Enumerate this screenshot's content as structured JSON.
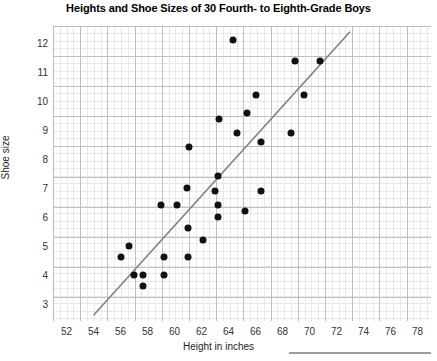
{
  "chart_data": {
    "type": "scatter",
    "title": "Heights and Shoe Sizes of 30 Fourth- to Eighth-Grade Boys",
    "xlabel": "Height in inches",
    "ylabel": "Shoe size",
    "xlim": [
      51,
      79
    ],
    "ylim": [
      2.4,
      12.6
    ],
    "xticks": [
      52,
      54,
      56,
      58,
      60,
      62,
      64,
      66,
      68,
      70,
      72,
      74,
      76,
      78
    ],
    "yticks": [
      3,
      4,
      5,
      6,
      7,
      8,
      9,
      10,
      11,
      12
    ],
    "grid": true,
    "minor_grid": true,
    "legend": "none",
    "point_color": "#111111",
    "trendline": {
      "show": true,
      "color": "#808080",
      "x_start": 54.0,
      "y_start": 2.6,
      "x_end": 73.0,
      "y_end": 12.4
    },
    "points": [
      {
        "x": 56.0,
        "y": 4.6
      },
      {
        "x": 56.6,
        "y": 5.0
      },
      {
        "x": 57.0,
        "y": 4.0
      },
      {
        "x": 57.7,
        "y": 4.0
      },
      {
        "x": 57.7,
        "y": 3.6
      },
      {
        "x": 59.0,
        "y": 6.4
      },
      {
        "x": 59.2,
        "y": 4.6
      },
      {
        "x": 59.2,
        "y": 4.0
      },
      {
        "x": 60.2,
        "y": 6.4
      },
      {
        "x": 60.9,
        "y": 7.0
      },
      {
        "x": 61.0,
        "y": 5.6
      },
      {
        "x": 61.0,
        "y": 4.6
      },
      {
        "x": 61.1,
        "y": 8.4
      },
      {
        "x": 62.1,
        "y": 5.2
      },
      {
        "x": 63.0,
        "y": 6.9
      },
      {
        "x": 63.2,
        "y": 7.4
      },
      {
        "x": 63.2,
        "y": 6.4
      },
      {
        "x": 63.2,
        "y": 6.0
      },
      {
        "x": 63.3,
        "y": 9.4
      },
      {
        "x": 64.3,
        "y": 12.1
      },
      {
        "x": 64.6,
        "y": 8.9
      },
      {
        "x": 65.2,
        "y": 6.2
      },
      {
        "x": 65.4,
        "y": 9.6
      },
      {
        "x": 66.0,
        "y": 10.2
      },
      {
        "x": 66.4,
        "y": 8.6
      },
      {
        "x": 66.4,
        "y": 6.9
      },
      {
        "x": 68.6,
        "y": 8.9
      },
      {
        "x": 68.9,
        "y": 11.4
      },
      {
        "x": 69.6,
        "y": 10.2
      },
      {
        "x": 70.8,
        "y": 11.4
      }
    ]
  },
  "footer": {
    "rule_present": true
  }
}
